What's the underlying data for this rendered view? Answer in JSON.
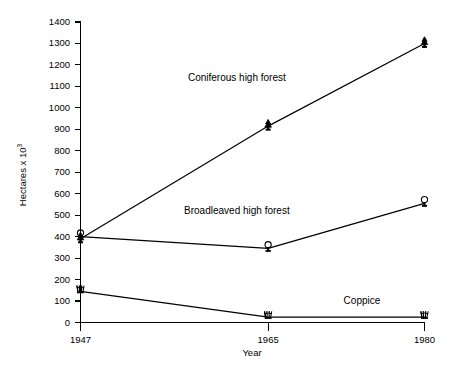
{
  "chart_data": {
    "type": "line",
    "title": "",
    "xlabel": "Year",
    "ylabel": "Hectares x 10",
    "ylabel_exponent": "3",
    "categories": [
      "1947",
      "1965",
      "1980"
    ],
    "x": [
      1947,
      1965,
      1980
    ],
    "xlim": [
      1947,
      1980
    ],
    "ylim": [
      0,
      1400
    ],
    "ytick_step": 100,
    "grid": false,
    "legend": "inline-annotations",
    "yticks": [
      "1400",
      "1300",
      "1200",
      "1100",
      "1000",
      "900",
      "800",
      "700",
      "600",
      "500",
      "400",
      "300",
      "200",
      "100",
      "0"
    ],
    "ytick_values": [
      1400,
      1300,
      1200,
      1100,
      1000,
      900,
      800,
      700,
      600,
      500,
      400,
      300,
      200,
      100,
      0
    ],
    "xticks": [
      "1947",
      "1965",
      "1980"
    ],
    "series": [
      {
        "name": "Coniferous high forest",
        "marker": "conifer-tree-icon",
        "values": [
          390,
          915,
          1300
        ],
        "label_x": 1962,
        "label_y": 1125,
        "label_anchor": "middle"
      },
      {
        "name": "Broadleaved high forest",
        "marker": "broadleaf-tree-icon",
        "values": [
          400,
          345,
          555
        ],
        "label_x": 1962,
        "label_y": 505,
        "label_anchor": "middle"
      },
      {
        "name": "Coppice",
        "marker": "coppice-shrub-icon",
        "values": [
          145,
          25,
          25
        ],
        "label_x": 1974,
        "label_y": 85,
        "label_anchor": "middle"
      }
    ],
    "annotations": [
      {
        "text": "Coniferous high forest"
      },
      {
        "text": "Broadleaved high forest"
      },
      {
        "text": "Coppice"
      }
    ]
  },
  "colors": {
    "background": "#ffffff",
    "ink": "#000000"
  }
}
